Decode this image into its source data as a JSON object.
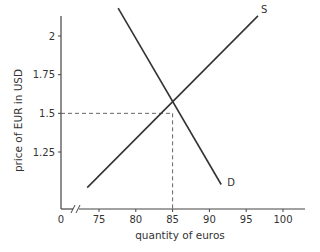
{
  "chart_data": {
    "type": "line",
    "title": "",
    "xlabel": "quantity of euros",
    "ylabel": "price of EUR in USD",
    "xlim": [
      72,
      103
    ],
    "ylim": [
      1.0,
      2.2
    ],
    "x_axis_break": true,
    "x_origin_label": "0",
    "xticks": [
      75,
      80,
      85,
      90,
      95,
      100
    ],
    "xtick_labels": [
      "75",
      "80",
      "85",
      "90",
      "95",
      "100"
    ],
    "yticks": [
      1.25,
      1.5,
      1.75,
      2.0
    ],
    "ytick_labels": [
      "1.25",
      "1.5",
      "1.75",
      "2"
    ],
    "grid": false,
    "series": [
      {
        "name": "S",
        "label": "S",
        "points": [
          [
            73.4,
            1.02
          ],
          [
            96.6,
            2.13
          ]
        ],
        "color": "#333333"
      },
      {
        "name": "D",
        "label": "D",
        "points": [
          [
            77.6,
            2.18
          ],
          [
            91.6,
            1.04
          ]
        ],
        "color": "#333333"
      }
    ],
    "equilibrium": {
      "x": 85,
      "y": 1.5,
      "guide_lines": "dashed"
    }
  }
}
